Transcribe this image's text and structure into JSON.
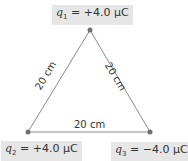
{
  "charges": [
    {
      "id": "q1",
      "symbol": "q",
      "sub": "1",
      "value": "= +4.0 μC",
      "x": 90,
      "y": 30
    },
    {
      "id": "q2",
      "symbol": "q",
      "sub": "2",
      "value": "= +4.0 μC",
      "x": 28,
      "y": 132
    },
    {
      "id": "q3",
      "symbol": "q",
      "sub": "3",
      "value": "= −4.0 μC",
      "x": 150,
      "y": 132
    }
  ],
  "sides": {
    "left": "20 cm",
    "right": "20 cm",
    "bottom": "20 cm"
  },
  "colors": {
    "line": "#8a8a8a",
    "dot": "#707070",
    "label_bg": "#e6e6e6"
  }
}
